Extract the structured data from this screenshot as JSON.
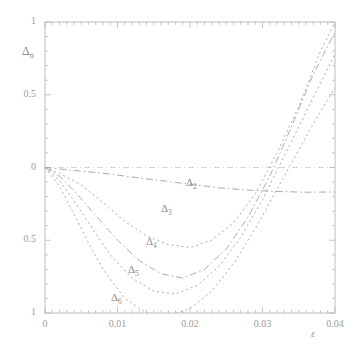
{
  "figure": {
    "ylabel": "Δn",
    "ylabel_base": "Δ",
    "ylabel_sub": "n",
    "xlabel": "ε",
    "background": "#ffffff",
    "ink_color": "#9a9a9a"
  },
  "axes": {
    "x_ticks": [
      "0",
      "0.01",
      "0.02",
      "0.03",
      "0.04"
    ],
    "x_tick_values": [
      0,
      0.01,
      0.02,
      0.03,
      0.04
    ],
    "y_ticks": [
      "1",
      "0.5",
      "0",
      "0.5",
      "1"
    ],
    "y_tick_values": [
      1,
      0.5,
      0,
      -0.5,
      -1
    ]
  },
  "curve_labels": [
    {
      "base": "Δ",
      "sub": "2",
      "x": 186,
      "y": 176
    },
    {
      "base": "Δ",
      "sub": "3",
      "x": 161,
      "y": 202
    },
    {
      "base": "Δ",
      "sub": "4",
      "x": 146,
      "y": 235
    },
    {
      "base": "Δ",
      "sub": "5",
      "x": 128,
      "y": 263
    },
    {
      "base": "Δ",
      "sub": "6",
      "x": 111,
      "y": 291
    }
  ],
  "chart_data": {
    "type": "line",
    "title": "",
    "xlabel": "ε",
    "ylabel": "Δn",
    "xlim": [
      0,
      0.04
    ],
    "ylim": [
      -1,
      1
    ],
    "grid": false,
    "legend": "inline-curve-labels",
    "x_ticks": [
      0,
      0.01,
      0.02,
      0.03,
      0.04
    ],
    "y_ticks": [
      1,
      0.5,
      0,
      -0.5,
      -1
    ],
    "series": [
      {
        "name": "Δ2",
        "style": "dash-dot",
        "x": [
          0,
          0.002,
          0.005,
          0.008,
          0.012,
          0.016,
          0.02,
          0.024,
          0.028,
          0.032,
          0.036,
          0.04
        ],
        "values": [
          0,
          -0.01,
          -0.025,
          -0.04,
          -0.065,
          -0.09,
          -0.115,
          -0.14,
          -0.155,
          -0.165,
          -0.17,
          -0.168
        ]
      },
      {
        "name": "Δ3",
        "style": "dotted",
        "x": [
          0,
          0.002,
          0.005,
          0.008,
          0.011,
          0.014,
          0.017,
          0.02,
          0.023,
          0.026,
          0.029,
          0.032,
          0.035,
          0.038,
          0.04
        ],
        "values": [
          0,
          -0.04,
          -0.12,
          -0.24,
          -0.37,
          -0.47,
          -0.53,
          -0.55,
          -0.5,
          -0.38,
          -0.18,
          0.1,
          0.42,
          0.8,
          1.0
        ]
      },
      {
        "name": "Δ4",
        "style": "dash-dot",
        "x": [
          0,
          0.002,
          0.004,
          0.007,
          0.01,
          0.013,
          0.016,
          0.019,
          0.022,
          0.025,
          0.028,
          0.031,
          0.034,
          0.037,
          0.04
        ],
        "values": [
          0,
          -0.06,
          -0.16,
          -0.33,
          -0.5,
          -0.64,
          -0.73,
          -0.76,
          -0.7,
          -0.56,
          -0.34,
          -0.06,
          0.28,
          0.64,
          0.93
        ]
      },
      {
        "name": "Δ5",
        "style": "dotted",
        "x": [
          0,
          0.002,
          0.004,
          0.006,
          0.009,
          0.012,
          0.015,
          0.018,
          0.021,
          0.024,
          0.027,
          0.03,
          0.034,
          0.038,
          0.04
        ],
        "values": [
          0,
          -0.09,
          -0.23,
          -0.38,
          -0.6,
          -0.76,
          -0.85,
          -0.87,
          -0.81,
          -0.68,
          -0.48,
          -0.22,
          0.18,
          0.58,
          0.78
        ]
      },
      {
        "name": "Δ6",
        "style": "dotted",
        "x": [
          0,
          0.002,
          0.004,
          0.006,
          0.008,
          0.011,
          0.014,
          0.017,
          0.02,
          0.023,
          0.026,
          0.029,
          0.033,
          0.037,
          0.04
        ],
        "values": [
          0,
          -0.13,
          -0.32,
          -0.52,
          -0.7,
          -0.9,
          -1.0,
          -1.02,
          -0.97,
          -0.85,
          -0.66,
          -0.42,
          -0.06,
          0.3,
          0.55
        ]
      }
    ]
  }
}
